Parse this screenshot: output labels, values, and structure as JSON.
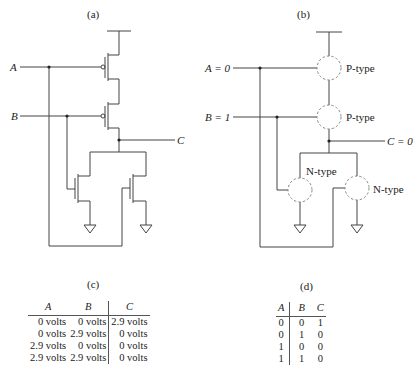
{
  "panels": {
    "a": {
      "caption": "(a)",
      "input_a_label": "A",
      "input_b_label": "B",
      "output_label": "C"
    },
    "b": {
      "caption": "(b)",
      "input_a_label": "A = 0",
      "input_b_label": "B = 1",
      "output_label": "C = 0",
      "transistor_labels": {
        "top_p": "P-type",
        "bottom_p": "P-type",
        "left_n": "N-type",
        "right_n": "N-type"
      }
    },
    "c": {
      "caption": "(c)",
      "headers": [
        "A",
        "B",
        "C"
      ],
      "rows": [
        [
          "0 volts",
          "0 volts",
          "2.9 volts"
        ],
        [
          "0 volts",
          "2.9 volts",
          "0 volts"
        ],
        [
          "2.9 volts",
          "0 volts",
          "0 volts"
        ],
        [
          "2.9 volts",
          "2.9 volts",
          "0 volts"
        ]
      ]
    },
    "d": {
      "caption": "(d)",
      "headers": [
        "A",
        "B",
        "C"
      ],
      "rows": [
        [
          "0",
          "0",
          "1"
        ],
        [
          "0",
          "1",
          "0"
        ],
        [
          "1",
          "0",
          "0"
        ],
        [
          "1",
          "1",
          "0"
        ]
      ]
    }
  },
  "colors": {
    "wire": "#444444",
    "dashed_circle": "#888888",
    "text": "#222222"
  }
}
